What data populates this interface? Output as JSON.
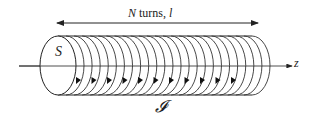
{
  "diagram": {
    "labels": {
      "length_annotation_N": "N",
      "length_annotation_rest": " turns, ",
      "length_annotation_l": "l",
      "area": "S",
      "axis": "z",
      "current": "𝓘"
    },
    "colors": {
      "stroke": "#222222",
      "background": "#ffffff"
    },
    "coil_turns_drawn": 24,
    "current_arrows_drawn": 11
  }
}
